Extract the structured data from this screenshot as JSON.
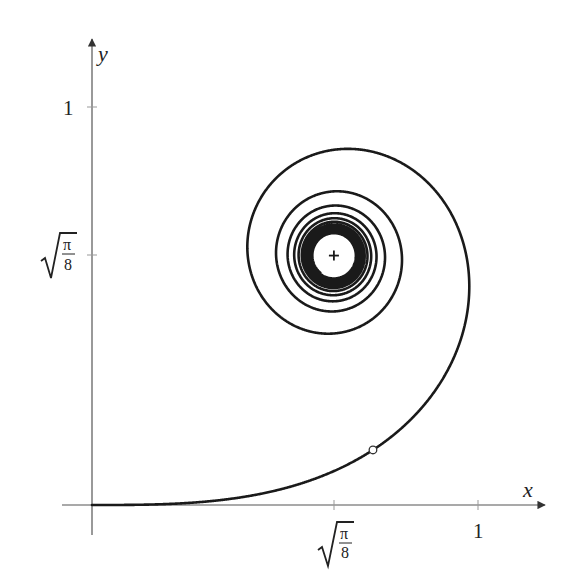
{
  "chart_data": {
    "type": "line",
    "title": "",
    "xlabel": "x",
    "ylabel": "y",
    "xlim": [
      -0.077,
      1.173
    ],
    "ylim": [
      -0.075,
      1.176
    ],
    "grid": false,
    "legend": null,
    "x_ticks": [
      {
        "value": 0.6267,
        "label": "√(π/8)",
        "label_num": "π",
        "label_den": "8"
      },
      {
        "value": 1,
        "label": "1"
      }
    ],
    "y_ticks": [
      {
        "value": 0.6267,
        "label": "√(π/8)",
        "label_num": "π",
        "label_den": "8"
      },
      {
        "value": 1,
        "label": "1"
      }
    ],
    "series": [
      {
        "name": "clothoid",
        "param": "t",
        "t_range": [
          0,
          9
        ],
        "color": "#1a1a1a",
        "key_points": [
          {
            "t": 0,
            "x": 0,
            "y": 0
          },
          {
            "t": 1.2533,
            "x": 0.9775,
            "y": 0.4959,
            "note": "max x"
          },
          {
            "t": 1.7725,
            "x": 0.6863,
            "y": 0.8948,
            "note": "max y"
          },
          {
            "t": 2.1708,
            "x": 0.4044,
            "y": 0.6896,
            "note": "min x"
          },
          {
            "t": "∞",
            "x": 0.6267,
            "y": 0.6267,
            "note": "limit point"
          }
        ]
      }
    ],
    "annotations": [
      {
        "type": "marker",
        "shape": "open-circle",
        "t": 0.75,
        "x": 0.726,
        "y": 0.139
      },
      {
        "type": "marker",
        "shape": "plus",
        "x": 0.6267,
        "y": 0.6267,
        "label": "limit point"
      }
    ]
  },
  "axes": {
    "x_label": "x",
    "y_label": "y",
    "x_tick_1": "1",
    "y_tick_1": "1",
    "sqrt_num": "π",
    "sqrt_den": "8"
  },
  "colors": {
    "axis": "#555555",
    "curve": "#1a1a1a",
    "background": "#ffffff"
  }
}
